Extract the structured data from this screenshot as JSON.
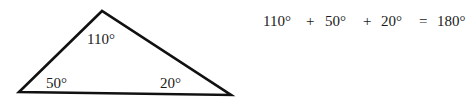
{
  "diagram": {
    "type": "triangle",
    "vertices": {
      "apex": [
        102,
        11
      ],
      "left": [
        19,
        92
      ],
      "right": [
        231,
        95
      ]
    },
    "stroke_color": "#111111",
    "angles": {
      "top": "110°",
      "left": "50°",
      "right": "20°"
    }
  },
  "equation": {
    "term1": "110°",
    "op1": "+",
    "term2": "50°",
    "op2": "+",
    "term3": "20°",
    "equals": "=",
    "result": "180°"
  }
}
